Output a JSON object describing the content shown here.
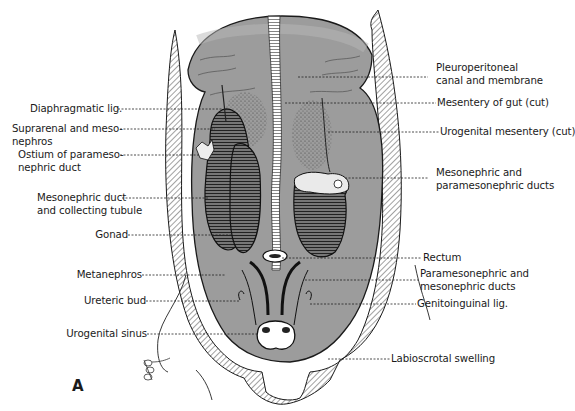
{
  "figure": {
    "panel_letter": "A",
    "colors": {
      "cavity_fill": "#9a9a9a",
      "cavity_light": "#b5b5b5",
      "line": "#1a1a1a",
      "hatch": "#555555",
      "background": "#ffffff"
    },
    "labels_left": [
      {
        "id": "diaphragmatic-lig",
        "text": "Diaphragmatic lig."
      },
      {
        "id": "suprarenal",
        "line1": "Suprarenal and meso-",
        "line2": "nephros"
      },
      {
        "id": "ostium",
        "line1": "Ostium of parameso-",
        "line2": "nephric duct"
      },
      {
        "id": "mesonephric-duct-tubule",
        "line1": "Mesonephric duct",
        "line2": "and collecting tubule"
      },
      {
        "id": "gonad",
        "text": "Gonad"
      },
      {
        "id": "metanephros",
        "text": "Metanephros"
      },
      {
        "id": "ureteric-bud",
        "text": "Ureteric bud"
      },
      {
        "id": "urogenital-sinus",
        "text": "Urogenital sinus"
      }
    ],
    "labels_right": [
      {
        "id": "pleuroperitoneal",
        "line1": "Pleuroperitoneal",
        "line2": "canal and membrane"
      },
      {
        "id": "mesentery-gut",
        "text": "Mesentery of gut (cut)"
      },
      {
        "id": "urogenital-mesentery",
        "text": "Urogenital mesentery (cut)"
      },
      {
        "id": "meso-parameso-ducts",
        "line1": "Mesonephric and",
        "line2": "paramesonephric ducts"
      },
      {
        "id": "rectum",
        "text": "Rectum"
      },
      {
        "id": "parameso-meso-ducts",
        "line1": "Paramesonephric and",
        "line2": "mesonephric ducts"
      },
      {
        "id": "genitoinguinal-lig",
        "text": "Genitoinguinal lig."
      },
      {
        "id": "labioscrotal-swelling",
        "text": "Labioscrotal swelling"
      }
    ]
  }
}
